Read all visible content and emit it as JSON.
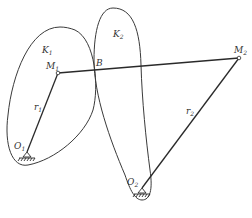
{
  "diagram": {
    "labels": {
      "K1": "K",
      "K1_sub": "1",
      "K2": "K",
      "K2_sub": "2",
      "M1": "M",
      "M1_sub": "1",
      "M2": "M",
      "M2_sub": "2",
      "B": "B",
      "O1": "O",
      "O1_sub": "1",
      "O2": "O",
      "O2_sub": "2",
      "r1": "r",
      "r1_sub": "1",
      "r2": "r",
      "r2_sub": "2"
    },
    "colors": {
      "stroke": "#3a3a3a",
      "background": "#ffffff"
    }
  }
}
